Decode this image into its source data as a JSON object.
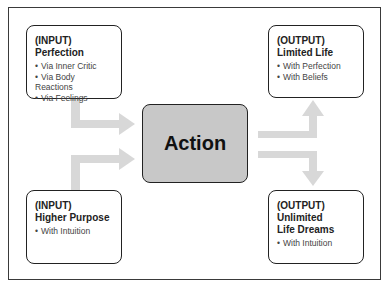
{
  "diagram": {
    "center": {
      "label": "Action"
    },
    "inputs": [
      {
        "tag": "(INPUT)",
        "title": "Perfection",
        "items": [
          "Via Inner Critic",
          "Via Body Reactions",
          "Via Feelings"
        ]
      },
      {
        "tag": "(INPUT)",
        "title": "Higher Purpose",
        "items": [
          "With Intuition"
        ]
      }
    ],
    "outputs": [
      {
        "tag": "(OUTPUT)",
        "title": "Limited Life",
        "items": [
          "With Perfection",
          "With Beliefs"
        ]
      },
      {
        "tag": "(OUTPUT)",
        "title": "Unlimited",
        "title2": "Life Dreams",
        "items": [
          "With Intuition"
        ]
      }
    ],
    "colors": {
      "arrow": "#d6d6d6",
      "action_fill": "#c8c8c8",
      "border": "#222222"
    }
  }
}
